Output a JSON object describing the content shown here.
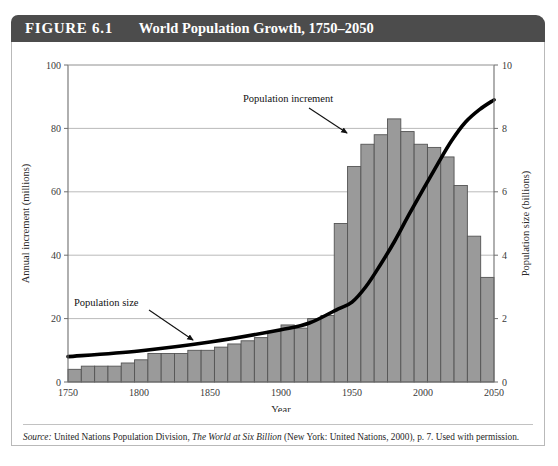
{
  "figure": {
    "number_label": "FIGURE 6.1",
    "title": "World Population Growth, 1750–2050"
  },
  "source": {
    "label": "Source:",
    "text_before_title": " United Nations Population Division, ",
    "italic_title": "The World at Six Billion",
    "text_after_title": " (New York: United Nations, 2000), p. 7. Used with permission."
  },
  "colors": {
    "title_bar": "#4c4c4c",
    "bar_fill": "#9a9a9a",
    "bar_stroke": "#545454",
    "line": "#000000",
    "grid": "#a8a8a8",
    "axis": "#6e6e6e",
    "frame": "#b9b9b9"
  },
  "annotations": [
    {
      "name": "population-increment",
      "label": "Population increment",
      "x": 232,
      "y": 60
    },
    {
      "name": "population-size",
      "label": "Population size",
      "x": 63,
      "y": 264
    }
  ],
  "chart_data": {
    "type": "bar",
    "title": "World Population Growth, 1750–2050",
    "xlabel": "Year",
    "ylabel": "Annual increment (millions)",
    "y2label": "Population size (billions)",
    "xlim": [
      1750,
      2050
    ],
    "ylim": [
      0,
      100
    ],
    "y2lim": [
      0,
      10
    ],
    "xticks": [
      1750,
      1800,
      1850,
      1900,
      1950,
      2000,
      2050
    ],
    "yticks": [
      0,
      20,
      40,
      60,
      80,
      100
    ],
    "y2ticks": [
      0,
      2,
      4,
      6,
      8,
      10
    ],
    "grid": true,
    "legend": "none",
    "series": [
      {
        "name": "Population increment",
        "type": "bar",
        "unit": "millions per year",
        "x": [
          1750,
          1760,
          1770,
          1780,
          1790,
          1800,
          1810,
          1820,
          1830,
          1840,
          1850,
          1860,
          1870,
          1880,
          1890,
          1900,
          1910,
          1920,
          1930,
          1940,
          1950,
          1960,
          1970,
          1980,
          1985,
          1990,
          1995,
          2000,
          2010,
          2020,
          2030,
          2040
        ],
        "values": [
          4,
          5,
          5,
          5,
          6,
          7,
          9,
          9,
          9,
          10,
          10,
          11,
          12,
          13,
          14,
          16,
          18,
          17,
          20,
          21,
          50,
          68,
          75,
          78,
          83,
          79,
          75,
          74,
          71,
          62,
          46,
          33
        ]
      },
      {
        "name": "Population size",
        "type": "line",
        "unit": "billions",
        "x": [
          1750,
          1800,
          1850,
          1900,
          1920,
          1940,
          1950,
          1960,
          1970,
          1980,
          1990,
          2000,
          2010,
          2020,
          2030,
          2040,
          2050
        ],
        "values": [
          0.8,
          0.98,
          1.26,
          1.65,
          1.86,
          2.3,
          2.52,
          3.02,
          3.7,
          4.44,
          5.27,
          6.07,
          6.85,
          7.6,
          8.2,
          8.6,
          8.9
        ]
      }
    ]
  },
  "axis": {
    "x_title": "Year",
    "y_left_title": "Annual increment (millions)",
    "y_right_title": "Population size (billions)"
  }
}
